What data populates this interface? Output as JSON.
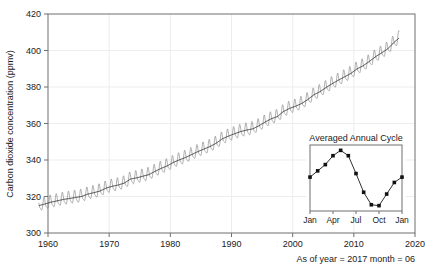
{
  "chart_data": {
    "type": "line",
    "title": "",
    "xlabel": "",
    "ylabel": "Carbon dioxide concentration (ppmv)",
    "xlim": [
      1960,
      2020
    ],
    "ylim": [
      300,
      420
    ],
    "xticks": [
      1960,
      1970,
      1980,
      1990,
      2000,
      2010,
      2020
    ],
    "xticklabels": [
      "1960",
      "1970",
      "1980",
      "1990",
      "2000",
      "2010",
      "2020"
    ],
    "yticks": [
      300,
      320,
      340,
      360,
      380,
      400,
      420
    ],
    "yticklabels": [
      "300",
      "320",
      "340",
      "360",
      "380",
      "400",
      "420"
    ],
    "grid": true,
    "legend": "none",
    "series": [
      {
        "name": "Monthly mean CO2 (with seasonal cycle)",
        "color": "#8c8c8c",
        "x": [
          1958.5,
          1959.5,
          1960.5,
          1961.5,
          1962.5,
          1963.5,
          1964.5,
          1965.5,
          1966.5,
          1967.5,
          1968.5,
          1969.5,
          1970.5,
          1971.5,
          1972.5,
          1973.5,
          1974.5,
          1975.5,
          1976.5,
          1977.5,
          1978.5,
          1979.5,
          1980.5,
          1981.5,
          1982.5,
          1983.5,
          1984.5,
          1985.5,
          1986.5,
          1987.5,
          1988.5,
          1989.5,
          1990.5,
          1991.5,
          1992.5,
          1993.5,
          1994.5,
          1995.5,
          1996.5,
          1997.5,
          1998.5,
          1999.5,
          2000.5,
          2001.5,
          2002.5,
          2003.5,
          2004.5,
          2005.5,
          2006.5,
          2007.5,
          2008.5,
          2009.5,
          2010.5,
          2011.5,
          2012.5,
          2013.5,
          2014.5,
          2015.5,
          2016.5,
          2017.45
        ],
        "annual_mean": [
          315.0,
          315.9,
          316.9,
          317.6,
          318.4,
          318.9,
          319.5,
          320.0,
          321.3,
          322.1,
          323.0,
          324.6,
          325.6,
          326.3,
          327.4,
          329.6,
          330.2,
          331.1,
          332.0,
          333.8,
          335.4,
          336.8,
          338.7,
          340.1,
          341.4,
          343.0,
          344.6,
          346.0,
          347.4,
          349.2,
          351.6,
          353.1,
          354.4,
          355.6,
          356.4,
          357.1,
          358.8,
          360.8,
          362.6,
          363.8,
          366.6,
          368.3,
          369.5,
          371.0,
          373.2,
          375.8,
          377.5,
          379.8,
          381.9,
          383.8,
          385.6,
          387.4,
          389.9,
          391.6,
          393.9,
          396.5,
          398.6,
          400.8,
          404.2,
          407.0
        ],
        "seasonal_amplitude_ppmv": 6.5,
        "seasonal_peak_month": "May",
        "seasonal_trough_month": "September"
      },
      {
        "name": "Smoothed trend",
        "color": "#2b2b2b",
        "description": "Deseasonalized long-term trend through the monthly means"
      }
    ],
    "inset": {
      "title": "Averaged Annual Cycle",
      "type": "line",
      "xticklabels": [
        "Jan",
        "Apr",
        "Jul",
        "Oct",
        "Jan"
      ],
      "xtickpositions": [
        0,
        3,
        6,
        9,
        12
      ],
      "categories": [
        "Jan",
        "Feb",
        "Mar",
        "Apr",
        "May",
        "Jun",
        "Jul",
        "Aug",
        "Sep",
        "Oct",
        "Nov",
        "Dec",
        "Jan"
      ],
      "values": [
        -0.1,
        0.6,
        1.3,
        2.3,
        2.9,
        2.3,
        0.3,
        -1.8,
        -3.2,
        -3.3,
        -2.0,
        -0.7,
        -0.1
      ],
      "ylim": [
        -3.9,
        3.5
      ],
      "ylabel": "",
      "xlabel": "",
      "grid": false,
      "marker": "square",
      "marker_color": "#111111",
      "line_color": "#1a1a1a"
    }
  },
  "caption": {
    "text": "As of year = 2017 month = 06"
  },
  "colors": {
    "background": "#ffffff",
    "frame": "#6f6f6f",
    "grid": "#ededed",
    "seasonal_series": "#8c8c8c",
    "trend_series": "#2b2b2b",
    "text": "#1a1a1a"
  }
}
